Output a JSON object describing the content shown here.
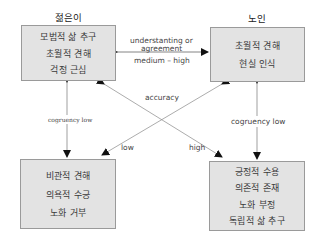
{
  "groups": {
    "young": {
      "title": "젊은이",
      "items": [
        "모범적 삶 추구",
        "초월적 견해",
        "걱정 근심"
      ]
    },
    "elderly": {
      "title": "노인",
      "items": [
        "초월적 견해",
        "현실 인식"
      ]
    },
    "bottom_left": {
      "items": [
        "비관적 견해",
        "의욕적 수긍",
        "노화 거부"
      ]
    },
    "bottom_right": {
      "items": [
        "긍정적 수용",
        "의존적 존재",
        "노화 부정",
        "독립적 삶 추구"
      ]
    }
  },
  "labels": {
    "understanding_line1": "understanting or",
    "understanding_line2": "agreement",
    "medium_high": "medium – high",
    "accuracy": "accuracy",
    "low": "low",
    "high": "high",
    "congruency_left": "cogruency low",
    "congruency_right": "cogruency low"
  }
}
